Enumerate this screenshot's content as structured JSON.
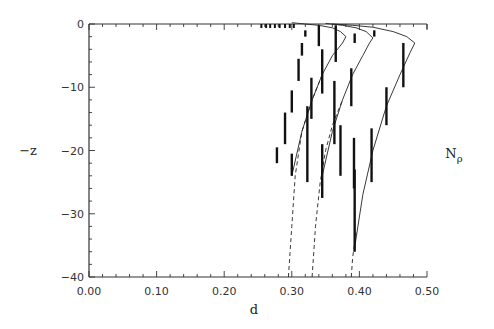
{
  "chart_data": {
    "type": "line",
    "title": "",
    "xlabel": "d",
    "ylabel": "−z",
    "annotation": "Nρ",
    "xlim": [
      0.0,
      0.5
    ],
    "ylim": [
      -40,
      0
    ],
    "xticks": [
      "0.00",
      "0.10",
      "0.20",
      "0.30",
      "0.40",
      "0.50"
    ],
    "yticks": [
      "0",
      "−10",
      "−20",
      "−30",
      "−40"
    ],
    "grid": false,
    "legend": null,
    "error_bars": [
      {
        "series": "A",
        "d": 0.278,
        "z_top": -19.5,
        "z_bottom": -22.0
      },
      {
        "series": "A",
        "d": 0.29,
        "z_top": -14.0,
        "z_bottom": -19.0
      },
      {
        "series": "A",
        "d": 0.3,
        "z_top": -10.5,
        "z_bottom": -14.0
      },
      {
        "series": "A",
        "d": 0.31,
        "z_top": -5.5,
        "z_bottom": -9.0
      },
      {
        "series": "A",
        "d": 0.315,
        "z_top": -3.0,
        "z_bottom": -5.0
      },
      {
        "series": "A",
        "d": 0.32,
        "z_top": -1.0,
        "z_bottom": -2.0
      },
      {
        "series": "A",
        "d": 0.3,
        "z_top": -20.5,
        "z_bottom": -24.0
      },
      {
        "series": "B",
        "d": 0.323,
        "z_top": -13.0,
        "z_bottom": -25.0
      },
      {
        "series": "B",
        "d": 0.329,
        "z_top": -8.5,
        "z_bottom": -15.0
      },
      {
        "series": "B",
        "d": 0.345,
        "z_top": -4.0,
        "z_bottom": -11.0
      },
      {
        "series": "B",
        "d": 0.34,
        "z_top": -0.2,
        "z_bottom": -3.5
      },
      {
        "series": "B",
        "d": 0.345,
        "z_top": -19.0,
        "z_bottom": -27.5
      },
      {
        "series": "B",
        "d": 0.372,
        "z_top": -16.0,
        "z_bottom": -24.0
      },
      {
        "series": "C",
        "d": 0.363,
        "z_top": -9.0,
        "z_bottom": -19.0
      },
      {
        "series": "C",
        "d": 0.365,
        "z_top": -0.2,
        "z_bottom": -6.0
      },
      {
        "series": "C",
        "d": 0.388,
        "z_top": -7.0,
        "z_bottom": -13.0
      },
      {
        "series": "C",
        "d": 0.392,
        "z_top": -18.0,
        "z_bottom": -26.0
      },
      {
        "series": "C",
        "d": 0.393,
        "z_top": -1.5,
        "z_bottom": -3.0
      },
      {
        "series": "D",
        "d": 0.393,
        "z_top": -23.0,
        "z_bottom": -36.0
      },
      {
        "series": "D",
        "d": 0.418,
        "z_top": -16.5,
        "z_bottom": -25.0
      },
      {
        "series": "D",
        "d": 0.44,
        "z_top": -10.0,
        "z_bottom": -16.0
      },
      {
        "series": "D",
        "d": 0.465,
        "z_top": -3.0,
        "z_bottom": -10.0
      },
      {
        "series": "D",
        "d": 0.422,
        "z_top": -1.0,
        "z_bottom": -2.0
      }
    ],
    "series": [
      {
        "name": "model 1 (solid)",
        "style": "solid",
        "x": [
          0.3,
          0.315,
          0.33,
          0.345,
          0.36,
          0.375,
          0.38,
          0.372,
          0.36,
          0.34,
          0.32,
          0.3
        ],
        "y": [
          -24.0,
          -17.0,
          -12.0,
          -8.0,
          -5.0,
          -3.0,
          -2.0,
          -1.2,
          -0.6,
          -0.2,
          0.0,
          0.2
        ]
      },
      {
        "name": "model 1 (dashed)",
        "style": "dashed",
        "x": [
          0.295,
          0.3,
          0.305,
          0.315,
          0.33,
          0.345
        ],
        "y": [
          -40.0,
          -32.0,
          -24.0,
          -17.0,
          -12.0,
          -8.0
        ]
      },
      {
        "name": "model 2 (solid)",
        "style": "solid",
        "x": [
          0.345,
          0.36,
          0.375,
          0.39,
          0.405,
          0.415,
          0.42,
          0.41,
          0.395,
          0.375,
          0.35
        ],
        "y": [
          -24.0,
          -17.0,
          -12.0,
          -8.0,
          -5.0,
          -3.0,
          -2.2,
          -1.2,
          -0.6,
          -0.2,
          0.1
        ]
      },
      {
        "name": "model 2 (dashed)",
        "style": "dashed",
        "x": [
          0.33,
          0.335,
          0.342,
          0.35,
          0.36,
          0.375
        ],
        "y": [
          -40.0,
          -32.0,
          -25.0,
          -20.0,
          -16.0,
          -12.0
        ]
      },
      {
        "name": "model 3 (solid)",
        "style": "solid",
        "x": [
          0.392,
          0.405,
          0.42,
          0.44,
          0.46,
          0.475,
          0.482,
          0.47,
          0.45,
          0.42,
          0.39,
          0.36
        ],
        "y": [
          -36.0,
          -27.0,
          -20.0,
          -13.0,
          -8.0,
          -4.5,
          -3.0,
          -2.0,
          -1.2,
          -0.5,
          -0.2,
          0.0
        ]
      },
      {
        "name": "model 3 (dashed)",
        "style": "dashed",
        "x": [
          0.388,
          0.39,
          0.395
        ],
        "y": [
          -40.0,
          -37.0,
          -33.0
        ]
      }
    ],
    "top_markers": [
      0.255,
      0.262,
      0.268,
      0.275,
      0.282,
      0.29,
      0.297,
      0.303
    ]
  }
}
